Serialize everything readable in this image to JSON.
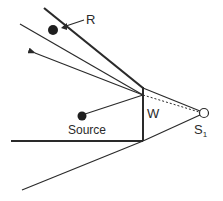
{
  "diagram": {
    "labels": {
      "receiver": "R",
      "source": "Source",
      "wall": "W",
      "image_source": "S",
      "image_source_subscript": "1"
    },
    "colors": {
      "line": "#2a2a2a",
      "background": "#ffffff"
    },
    "elements": [
      "receiver-dot",
      "source-dot",
      "wall",
      "image-source-circle",
      "reflected-ray-arrow",
      "boundary-lines",
      "dotted-line-to-image-source"
    ]
  }
}
